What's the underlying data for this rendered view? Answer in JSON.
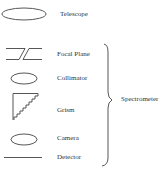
{
  "diagram": {
    "type": "optical-path-legend",
    "components": [
      {
        "id": "telescope",
        "label": "Telescope",
        "symbol": "ellipse-large"
      },
      {
        "id": "focal-plane",
        "label": "Focal Plane",
        "symbol": "broken-double-line"
      },
      {
        "id": "collimator",
        "label": "Collimator",
        "symbol": "ellipse-small"
      },
      {
        "id": "grism",
        "label": "Grism",
        "symbol": "stepped-triangle"
      },
      {
        "id": "camera",
        "label": "Camera",
        "symbol": "ellipse-small"
      },
      {
        "id": "detector",
        "label": "Detector",
        "symbol": "horizontal-line"
      }
    ],
    "group": {
      "label": "Spectrometer",
      "members": [
        "Focal Plane",
        "Collimator",
        "Grism",
        "Camera",
        "Detector"
      ],
      "symbol": "right-curly-brace"
    },
    "colors": {
      "stroke": "#444444",
      "text": "#333333",
      "background": "#ffffff"
    }
  }
}
